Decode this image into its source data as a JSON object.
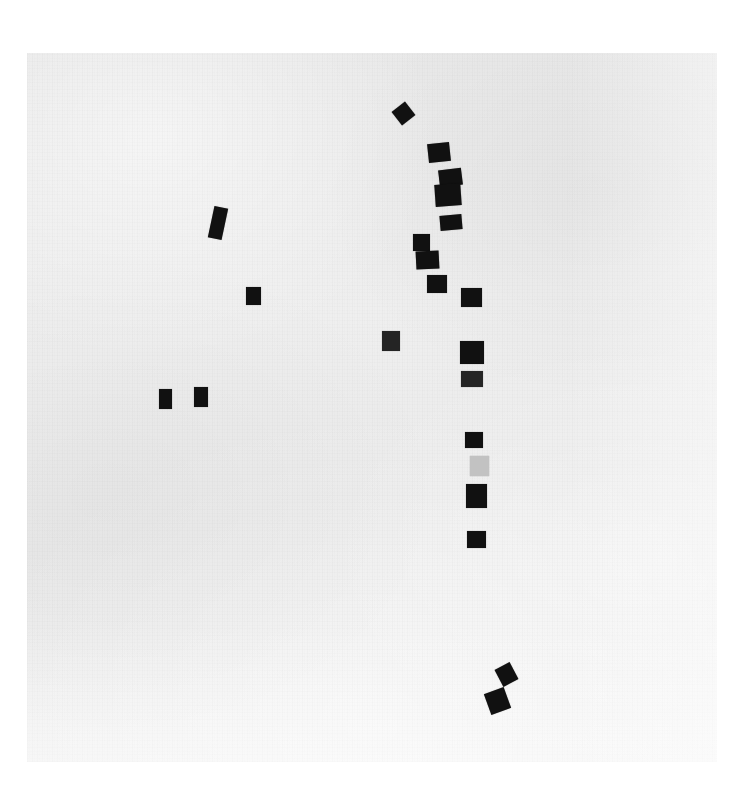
{
  "image": {
    "title": "Scanned mark field",
    "width": 744,
    "height": 799,
    "page_background": "#ffffff",
    "scan_field": {
      "x": 27,
      "y": 53,
      "width": 690,
      "height": 709,
      "base_color": "#ececec",
      "texture": "paper-grain-noise"
    }
  },
  "chart_data": {
    "type": "scatter",
    "xlabel": "",
    "ylabel": "",
    "xlim": [
      27,
      717
    ],
    "ylim": [
      53,
      762
    ],
    "grid": false,
    "legend": null,
    "marks": [
      {
        "id": "m01",
        "x": 403,
        "y": 113,
        "w": 17,
        "h": 17,
        "rotation": -38,
        "color": "#111111",
        "tone": "black",
        "cluster": "main-column"
      },
      {
        "id": "m02",
        "x": 439,
        "y": 152,
        "w": 22,
        "h": 19,
        "rotation": -6,
        "color": "#111111",
        "tone": "black",
        "cluster": "main-column"
      },
      {
        "id": "m03",
        "x": 450,
        "y": 177,
        "w": 23,
        "h": 17,
        "rotation": -7,
        "color": "#111111",
        "tone": "black",
        "cluster": "main-column"
      },
      {
        "id": "m04",
        "x": 448,
        "y": 195,
        "w": 26,
        "h": 22,
        "rotation": -4,
        "color": "#111111",
        "tone": "black",
        "cluster": "main-column"
      },
      {
        "id": "m05",
        "x": 451,
        "y": 222,
        "w": 22,
        "h": 15,
        "rotation": -5,
        "color": "#111111",
        "tone": "black",
        "cluster": "main-column"
      },
      {
        "id": "m06",
        "x": 421,
        "y": 242,
        "w": 17,
        "h": 17,
        "rotation": 0,
        "color": "#111111",
        "tone": "black",
        "cluster": "main-column"
      },
      {
        "id": "m07",
        "x": 427,
        "y": 260,
        "w": 23,
        "h": 18,
        "rotation": -3,
        "color": "#111111",
        "tone": "black",
        "cluster": "main-column"
      },
      {
        "id": "m08",
        "x": 437,
        "y": 284,
        "w": 20,
        "h": 18,
        "rotation": 0,
        "color": "#111111",
        "tone": "black",
        "cluster": "main-column"
      },
      {
        "id": "m09",
        "x": 471,
        "y": 297,
        "w": 21,
        "h": 19,
        "rotation": 0,
        "color": "#111111",
        "tone": "black",
        "cluster": "main-column"
      },
      {
        "id": "m10",
        "x": 391,
        "y": 341,
        "w": 18,
        "h": 20,
        "rotation": 0,
        "color": "#242424",
        "tone": "dark-grey",
        "cluster": "off-column"
      },
      {
        "id": "m11",
        "x": 472,
        "y": 352,
        "w": 24,
        "h": 23,
        "rotation": 0,
        "color": "#111111",
        "tone": "black",
        "cluster": "main-column"
      },
      {
        "id": "m12",
        "x": 472,
        "y": 379,
        "w": 22,
        "h": 16,
        "rotation": 0,
        "color": "#252525",
        "tone": "dark-grey",
        "cluster": "main-column"
      },
      {
        "id": "m13",
        "x": 474,
        "y": 440,
        "w": 18,
        "h": 16,
        "rotation": 0,
        "color": "#111111",
        "tone": "black",
        "cluster": "main-column"
      },
      {
        "id": "m14",
        "x": 479,
        "y": 466,
        "w": 19,
        "h": 20,
        "rotation": 0,
        "color": "#c2c2c2",
        "tone": "light-grey",
        "cluster": "main-column"
      },
      {
        "id": "m15",
        "x": 476,
        "y": 496,
        "w": 21,
        "h": 24,
        "rotation": 0,
        "color": "#111111",
        "tone": "black",
        "cluster": "main-column"
      },
      {
        "id": "m16",
        "x": 476,
        "y": 539,
        "w": 19,
        "h": 17,
        "rotation": 0,
        "color": "#111111",
        "tone": "black",
        "cluster": "main-column"
      },
      {
        "id": "m17",
        "x": 218,
        "y": 223,
        "w": 14,
        "h": 32,
        "rotation": 12,
        "color": "#111111",
        "tone": "black",
        "cluster": "left-group"
      },
      {
        "id": "m18",
        "x": 253,
        "y": 296,
        "w": 15,
        "h": 18,
        "rotation": 0,
        "color": "#111111",
        "tone": "black",
        "cluster": "left-group"
      },
      {
        "id": "m19",
        "x": 165,
        "y": 399,
        "w": 13,
        "h": 20,
        "rotation": 0,
        "color": "#111111",
        "tone": "black",
        "cluster": "left-group"
      },
      {
        "id": "m20",
        "x": 201,
        "y": 397,
        "w": 14,
        "h": 20,
        "rotation": 0,
        "color": "#111111",
        "tone": "black",
        "cluster": "left-group"
      },
      {
        "id": "m21",
        "x": 506,
        "y": 674,
        "w": 17,
        "h": 19,
        "rotation": -28,
        "color": "#111111",
        "tone": "black",
        "cluster": "bottom-pair"
      },
      {
        "id": "m22",
        "x": 497,
        "y": 701,
        "w": 21,
        "h": 22,
        "rotation": -20,
        "color": "#111111",
        "tone": "black",
        "cluster": "bottom-pair"
      }
    ]
  }
}
